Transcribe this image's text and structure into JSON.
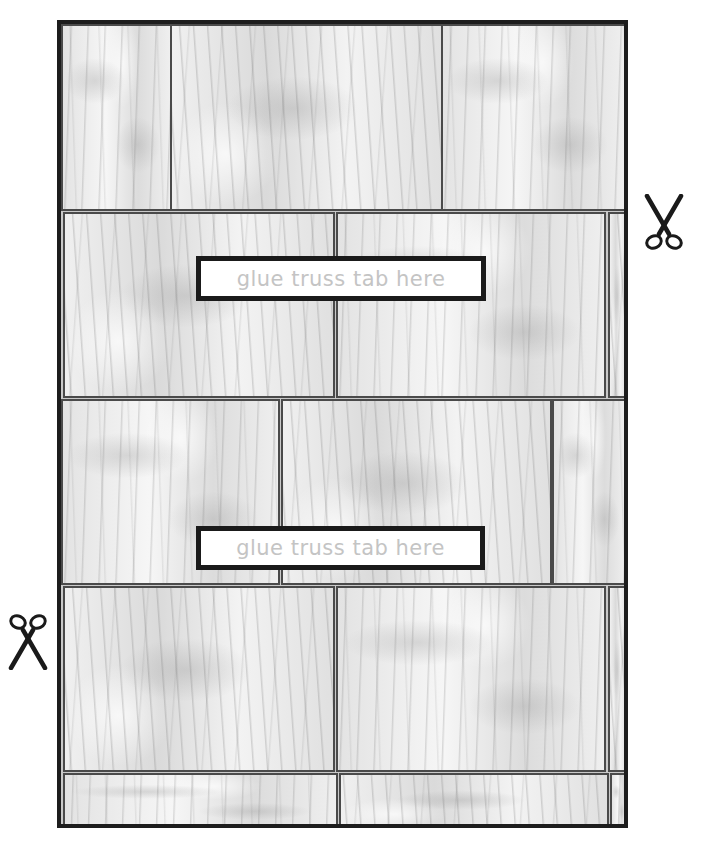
{
  "template": {
    "type": "printable wood-plank texture sheet",
    "frame_color": "#1d1d1d",
    "grain_base_color": "#ececec",
    "seam_color": "#4a4a4a",
    "rows": [
      {
        "name": "row-1",
        "planks": 3
      },
      {
        "name": "row-2",
        "planks": 3
      },
      {
        "name": "row-3",
        "planks": 3
      },
      {
        "name": "row-4",
        "planks": 3
      },
      {
        "name": "row-5",
        "planks": 3
      }
    ]
  },
  "labels": [
    {
      "text": "glue truss tab here",
      "text_color": "#c4c4c4"
    },
    {
      "text": "glue truss tab here",
      "text_color": "#c4c4c4"
    }
  ],
  "icons": {
    "cut_mark_right": "scissors-icon",
    "cut_mark_left": "scissors-icon"
  }
}
